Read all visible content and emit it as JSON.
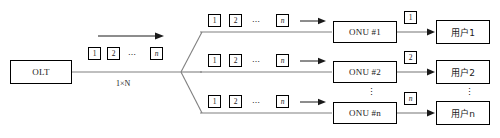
{
  "diagram": {
    "splitter_label": "1×N",
    "olt": {
      "label": "OLT"
    },
    "trunk_packets": {
      "first": "1",
      "second": "2",
      "ellipsis": "⋯",
      "last": "n"
    },
    "branches": [
      {
        "packets": {
          "first": "1",
          "second": "2",
          "ellipsis": "⋯",
          "last": "n"
        },
        "onu": "ONU #1",
        "drop_packet": "1",
        "user": "用户1"
      },
      {
        "packets": {
          "first": "1",
          "second": "2",
          "ellipsis": "⋯",
          "last": "n"
        },
        "onu": "ONU #2",
        "drop_packet": "2",
        "user": "用户2"
      },
      {
        "packets": {
          "first": "1",
          "second": "2",
          "ellipsis": "⋯",
          "last": "n"
        },
        "onu": "ONU #n",
        "drop_packet": "n",
        "user": "用户n"
      }
    ],
    "vertical_ellipsis": "⋮",
    "colors": {
      "line": "#808080",
      "box_border": "#000000",
      "text": "#1a1a1a",
      "background": "#ffffff"
    }
  }
}
